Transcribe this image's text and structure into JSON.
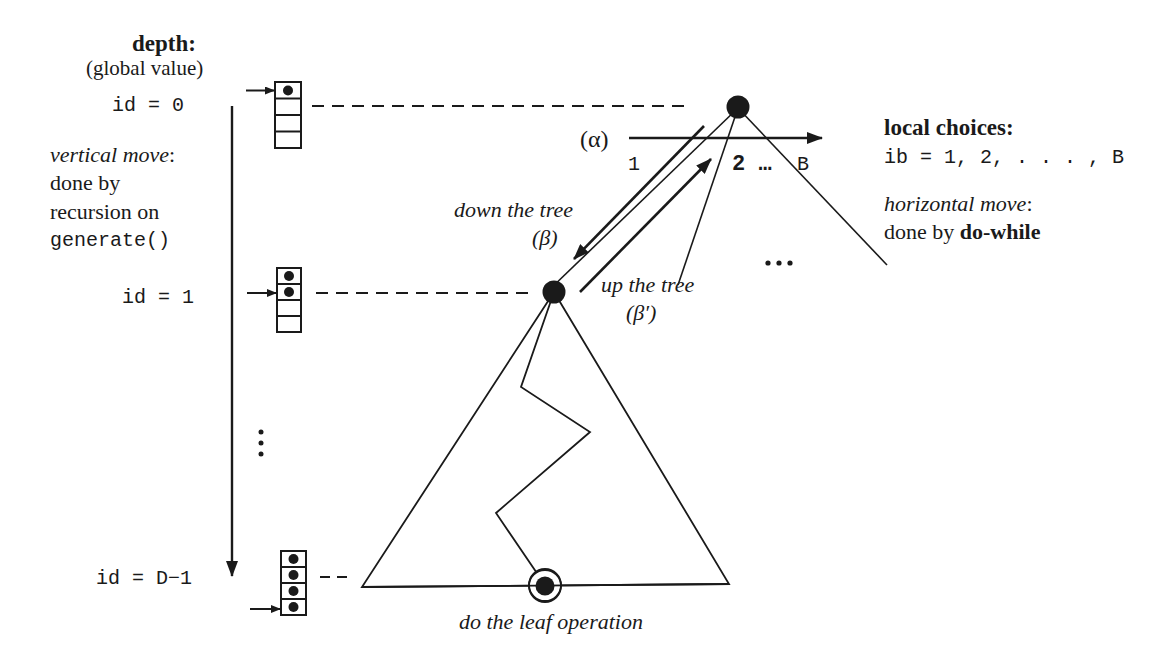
{
  "left_panel": {
    "depth_title": "depth:",
    "depth_subtitle": "(global value)",
    "levels": [
      {
        "label": "id = 0",
        "filled_cells": 1,
        "pointer_cell": 1
      },
      {
        "label": "id = 1",
        "filled_cells": 2,
        "pointer_cell": 2
      },
      {
        "label": "id = D−1",
        "filled_cells": 4,
        "pointer_cell": 4
      }
    ],
    "vertical_move": {
      "title": "vertical move",
      "colon": ":",
      "line1": "done by",
      "line2": "recursion on",
      "line3": "generate()"
    },
    "ellipsis": "⋮"
  },
  "tree": {
    "alpha_label": "(α)",
    "branch_labels": {
      "first": "1",
      "middle": "2 …",
      "last": "B"
    },
    "down_label": "down the tree",
    "down_symbol": "(β)",
    "up_label": "up the tree",
    "up_symbol": "(β′)",
    "more_branches": "…",
    "leaf_label": "do the leaf operation"
  },
  "right_panel": {
    "local_title": "local choices:",
    "ib_expr": "ib = 1, 2, . . . , B",
    "horizontal_title": "horizontal move",
    "colon": ":",
    "done_by": "done by ",
    "do_while": "do-while"
  },
  "colors": {
    "ink": "#1a1a1a",
    "background": "#ffffff"
  }
}
